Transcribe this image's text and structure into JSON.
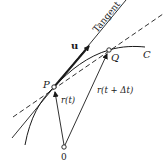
{
  "diagram": {
    "labels": {
      "tangent": "Tangent",
      "u": "u",
      "P": "P",
      "Q": "Q",
      "C": "C",
      "O": "0",
      "r_t": "r(t)",
      "r_t_dt": "r(t + Δt)"
    },
    "points": {
      "P": [
        54,
        87
      ],
      "Q": [
        109,
        50
      ],
      "O": [
        64,
        147
      ]
    },
    "colors": {
      "ink": "#1a1a1a",
      "background": "#ffffff"
    }
  }
}
